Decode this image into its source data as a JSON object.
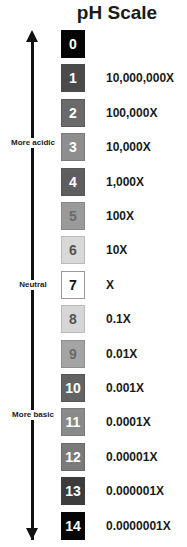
{
  "title": "pH Scale",
  "labels": {
    "acidic": "More acidic",
    "neutral": "Neutral",
    "basic": "More basic"
  },
  "scale": [
    {
      "ph": "0",
      "multiplier": "",
      "bg": "#050505",
      "fg": "#ffffff",
      "border": "#050505"
    },
    {
      "ph": "1",
      "multiplier": "10,000,000X",
      "bg": "#4a4a4a",
      "fg": "#ffffff",
      "border": "#4a4a4a"
    },
    {
      "ph": "2",
      "multiplier": "100,000X",
      "bg": "#6a6a6a",
      "fg": "#ffffff",
      "border": "#5a5a5a"
    },
    {
      "ph": "3",
      "multiplier": "10,000X",
      "bg": "#8e8e8e",
      "fg": "#ffffff",
      "border": "#7a7a7a"
    },
    {
      "ph": "4",
      "multiplier": "1,000X",
      "bg": "#5e5e5e",
      "fg": "#ffffff",
      "border": "#555555"
    },
    {
      "ph": "5",
      "multiplier": "100X",
      "bg": "#9a9a9a",
      "fg": "#6a6a6a",
      "border": "#888888"
    },
    {
      "ph": "6",
      "multiplier": "10X",
      "bg": "#d8d8d8",
      "fg": "#555555",
      "border": "#bbbbbb"
    },
    {
      "ph": "7",
      "multiplier": "X",
      "bg": "#ffffff",
      "fg": "#111111",
      "border": "#9a9a9a"
    },
    {
      "ph": "8",
      "multiplier": "0.1X",
      "bg": "#d6d6d6",
      "fg": "#555555",
      "border": "#bbbbbb"
    },
    {
      "ph": "9",
      "multiplier": "0.01X",
      "bg": "#a4a4a4",
      "fg": "#6a6a6a",
      "border": "#8e8e8e"
    },
    {
      "ph": "10",
      "multiplier": "0.001X",
      "bg": "#636363",
      "fg": "#ffffff",
      "border": "#555555"
    },
    {
      "ph": "11",
      "multiplier": "0.0001X",
      "bg": "#8a8a8a",
      "fg": "#ffffff",
      "border": "#7a7a7a"
    },
    {
      "ph": "12",
      "multiplier": "0.00001X",
      "bg": "#7a7a7a",
      "fg": "#ffffff",
      "border": "#6a6a6a"
    },
    {
      "ph": "13",
      "multiplier": "0.000001X",
      "bg": "#3c3c3c",
      "fg": "#ffffff",
      "border": "#3c3c3c"
    },
    {
      "ph": "14",
      "multiplier": "0.0000001X",
      "bg": "#050505",
      "fg": "#ffffff",
      "border": "#050505"
    }
  ]
}
